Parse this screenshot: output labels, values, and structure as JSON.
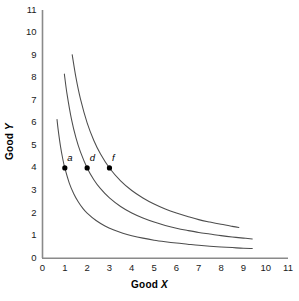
{
  "chart_data": {
    "type": "line",
    "title": "",
    "xlabel": "Good X",
    "ylabel": "Good Y",
    "xlim": [
      0,
      11
    ],
    "ylim": [
      0,
      11
    ],
    "xticks": [
      0,
      1,
      2,
      3,
      4,
      5,
      6,
      7,
      8,
      9,
      10,
      11
    ],
    "yticks": [
      0,
      1,
      2,
      3,
      4,
      5,
      6,
      7,
      8,
      9,
      10,
      11
    ],
    "grid": false,
    "legend": "none",
    "line_color": "#4d4d4d",
    "axis_color": "#808080",
    "marker_color": "#000000",
    "series": [
      {
        "name": "indifference-curve-1",
        "description": "lowest indifference curve through point a",
        "constant_k": 4,
        "x": [
          0.65,
          0.7,
          0.8,
          0.9,
          1.0,
          1.2,
          1.4,
          1.6,
          1.8,
          2.0,
          2.4,
          2.8,
          3.2,
          3.6,
          4.0,
          4.5,
          5.0,
          5.5,
          6.0,
          6.5,
          7.0,
          7.5,
          8.0,
          8.5,
          9.0,
          9.4
        ],
        "y": [
          6.15,
          5.71,
          5.0,
          4.44,
          4.0,
          3.33,
          2.86,
          2.5,
          2.22,
          2.0,
          1.67,
          1.43,
          1.25,
          1.11,
          1.0,
          0.89,
          0.8,
          0.73,
          0.67,
          0.62,
          0.57,
          0.53,
          0.5,
          0.47,
          0.44,
          0.43
        ]
      },
      {
        "name": "indifference-curve-2",
        "description": "middle indifference curve through point d",
        "constant_k": 8,
        "x": [
          0.98,
          1.1,
          1.3,
          1.5,
          1.7,
          2.0,
          2.3,
          2.6,
          3.0,
          3.5,
          4.0,
          4.5,
          5.0,
          5.5,
          6.0,
          6.5,
          7.0,
          7.5,
          8.0,
          8.5,
          9.0,
          9.4
        ],
        "y": [
          8.16,
          7.27,
          6.15,
          5.33,
          4.71,
          4.0,
          3.48,
          3.08,
          2.67,
          2.29,
          2.0,
          1.78,
          1.6,
          1.45,
          1.33,
          1.23,
          1.14,
          1.07,
          1.0,
          0.94,
          0.89,
          0.85
        ]
      },
      {
        "name": "indifference-curve-3",
        "description": "highest indifference curve through point f",
        "constant_k": 12,
        "x": [
          1.33,
          1.5,
          1.7,
          2.0,
          2.3,
          2.6,
          3.0,
          3.5,
          4.0,
          4.5,
          5.0,
          5.5,
          6.0,
          6.5,
          7.0,
          7.5,
          8.0,
          8.5,
          8.8
        ],
        "y": [
          9.02,
          8.0,
          7.06,
          6.0,
          5.22,
          4.62,
          4.0,
          3.43,
          3.0,
          2.67,
          2.4,
          2.18,
          2.0,
          1.85,
          1.71,
          1.6,
          1.5,
          1.41,
          1.36
        ]
      }
    ],
    "points": [
      {
        "label": "a",
        "x": 1,
        "y": 4
      },
      {
        "label": "d",
        "x": 2,
        "y": 4
      },
      {
        "label": "f",
        "x": 3,
        "y": 4
      }
    ]
  },
  "axes": {
    "x_title_prefix": "Good ",
    "x_title_var": "X",
    "y_title_prefix": "Good ",
    "y_title_var": "Y"
  },
  "tick_text": {
    "x": [
      "0",
      "1",
      "2",
      "3",
      "4",
      "5",
      "6",
      "7",
      "8",
      "9",
      "10",
      "11"
    ],
    "y": [
      "0",
      "1",
      "2",
      "3",
      "4",
      "5",
      "6",
      "7",
      "8",
      "9",
      "10",
      "11"
    ]
  },
  "point_text": {
    "a": "a",
    "d": "d",
    "f": "f"
  }
}
